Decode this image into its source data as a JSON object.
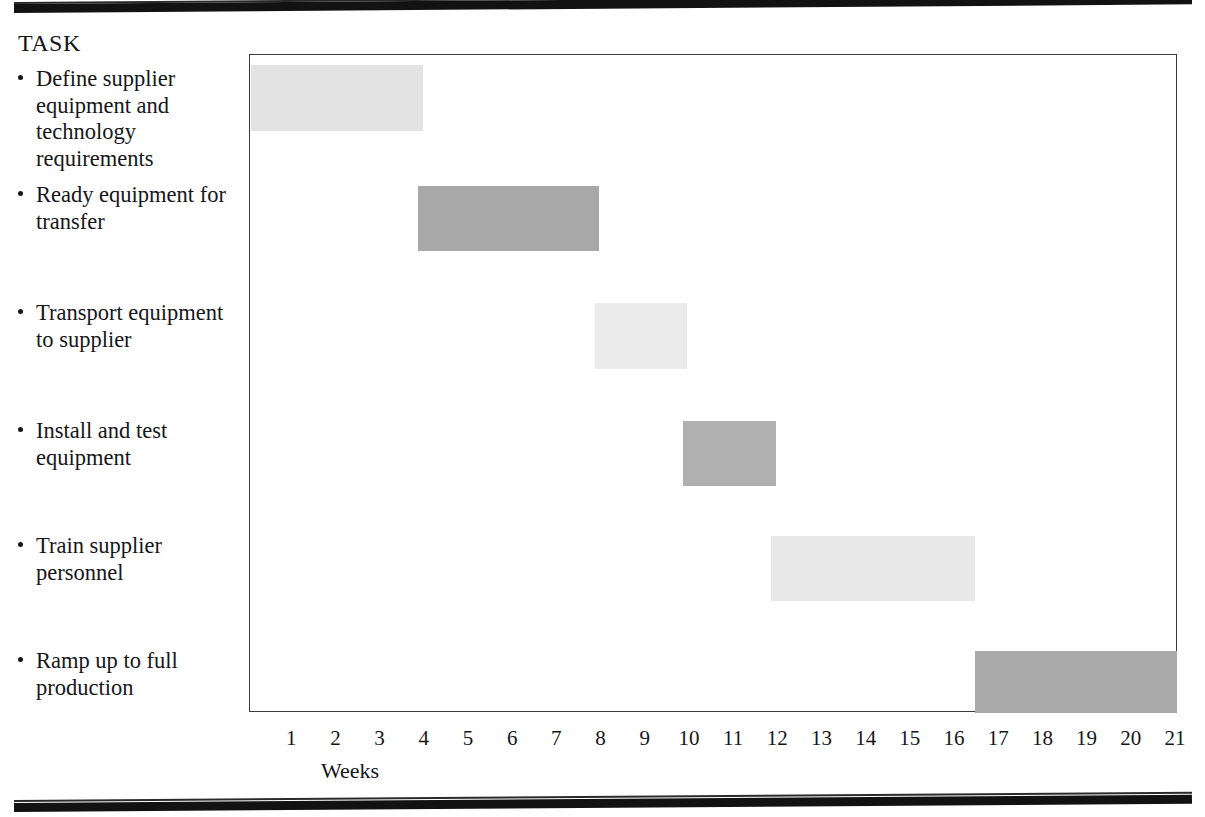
{
  "chart_data": {
    "type": "bar",
    "orientation": "horizontal",
    "title": "",
    "xlabel": "Weeks",
    "ylabel": "TASK",
    "xlim": [
      0,
      21
    ],
    "grid": false,
    "legend": null,
    "tick_labels": [
      "1",
      "2",
      "3",
      "4",
      "5",
      "6",
      "7",
      "8",
      "9",
      "10",
      "11",
      "12",
      "13",
      "14",
      "15",
      "16",
      "17",
      "18",
      "19",
      "20",
      "21"
    ],
    "categories": [
      "Define supplier equipment and technology requirements",
      "Ready equipment for transfer",
      "Transport equipment to supplier",
      "Install and test equipment",
      "Train supplier personnel",
      "Ramp up to full production"
    ],
    "bars": [
      {
        "task": "Define supplier equipment and technology requirements",
        "start": 0.0,
        "end": 3.9,
        "duration": 3.9,
        "color": "#e3e3e3"
      },
      {
        "task": "Ready equipment for transfer",
        "start": 3.8,
        "end": 7.9,
        "duration": 4.1,
        "color": "#a8a8a8"
      },
      {
        "task": "Transport equipment to supplier",
        "start": 7.8,
        "end": 9.9,
        "duration": 2.1,
        "color": "#ebebeb"
      },
      {
        "task": "Install and test equipment",
        "start": 9.8,
        "end": 11.9,
        "duration": 2.1,
        "color": "#b0b0b0"
      },
      {
        "task": "Train supplier personnel",
        "start": 11.8,
        "end": 16.4,
        "duration": 4.6,
        "color": "#e8e8e8"
      },
      {
        "task": "Ramp up to full production",
        "start": 16.4,
        "end": 21.0,
        "duration": 4.6,
        "color": "#aaaaaa"
      }
    ]
  },
  "header": {
    "task_column_label": "TASK"
  },
  "tasks": [
    {
      "label": "Define supplier equipment and technology requirements",
      "top": 66
    },
    {
      "label": "Ready equipment for transfer",
      "top": 182
    },
    {
      "label": "Transport equipment to supplier",
      "top": 300
    },
    {
      "label": "Install and test equipment",
      "top": 418
    },
    {
      "label": "Train supplier personnel",
      "top": 533
    },
    {
      "label": "Ramp up to full production",
      "top": 648
    }
  ],
  "bar_rows": [
    {
      "top": 64,
      "height": 66
    },
    {
      "top": 185,
      "height": 65
    },
    {
      "top": 302,
      "height": 66
    },
    {
      "top": 420,
      "height": 65
    },
    {
      "top": 535,
      "height": 65
    },
    {
      "top": 650,
      "height": 62
    }
  ],
  "axis": {
    "title": "Weeks",
    "week_pixel_spacing": 44.19,
    "origin_x": 250
  }
}
